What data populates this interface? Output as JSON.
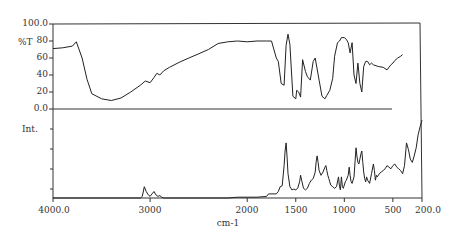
{
  "chart_data": [
    {
      "type": "line",
      "title": "",
      "panel": "upper",
      "ylabel": "%T",
      "xlabel": "cm-1",
      "xlim": [
        4000.0,
        200.0
      ],
      "ylim": [
        0.0,
        100.0
      ],
      "yticks": [
        "100.0",
        "80",
        "60",
        "40",
        "20",
        "0.0"
      ],
      "grid": false,
      "series": [
        {
          "name": "IR transmittance",
          "x": [
            4000,
            3900,
            3800,
            3760,
            3700,
            3650,
            3600,
            3500,
            3400,
            3300,
            3200,
            3100,
            3050,
            3000,
            2960,
            2930,
            2900,
            2860,
            2800,
            2700,
            2600,
            2500,
            2400,
            2300,
            2200,
            2100,
            2000,
            1900,
            1800,
            1750,
            1700,
            1680,
            1650,
            1620,
            1600,
            1580,
            1560,
            1530,
            1500,
            1490,
            1470,
            1450,
            1430,
            1400,
            1380,
            1350,
            1320,
            1300,
            1260,
            1230,
            1200,
            1180,
            1150,
            1120,
            1100,
            1070,
            1050,
            1030,
            1000,
            980,
            960,
            940,
            920,
            900,
            880,
            860,
            840,
            820,
            800,
            780,
            760,
            740,
            720,
            700,
            650,
            600,
            560,
            520,
            500,
            480,
            450,
            420,
            400
          ],
          "y": [
            71,
            72,
            74,
            79,
            60,
            35,
            18,
            12,
            10,
            13,
            20,
            28,
            33,
            31,
            37,
            42,
            40,
            45,
            49,
            55,
            60,
            65,
            70,
            77,
            79,
            80,
            79,
            80,
            80,
            80,
            60,
            56,
            30,
            28,
            75,
            88,
            76,
            15,
            12,
            22,
            20,
            14,
            58,
            44,
            38,
            34,
            56,
            60,
            34,
            15,
            12,
            16,
            22,
            36,
            62,
            78,
            80,
            84,
            84,
            82,
            78,
            66,
            78,
            40,
            30,
            54,
            30,
            20,
            50,
            56,
            56,
            52,
            54,
            52,
            50,
            49,
            46,
            52,
            54,
            57,
            60,
            62,
            64
          ]
        }
      ]
    },
    {
      "type": "line",
      "title": "",
      "panel": "lower",
      "ylabel": "Int.",
      "xlabel": "cm-1",
      "xlim": [
        4000.0,
        200.0
      ],
      "xticks": [
        "4000.0",
        "3000",
        "2000",
        "1500",
        "1000",
        "500",
        "200.0"
      ],
      "ylim": [
        0,
        100
      ],
      "grid": false,
      "series": [
        {
          "name": "Raman intensity",
          "x": [
            4000,
            3200,
            3100,
            3080,
            3060,
            3040,
            3020,
            3000,
            2980,
            2960,
            2940,
            2920,
            2900,
            2880,
            2860,
            2200,
            2100,
            2000,
            1900,
            1800,
            1780,
            1700,
            1680,
            1660,
            1640,
            1620,
            1610,
            1600,
            1590,
            1580,
            1560,
            1540,
            1520,
            1500,
            1480,
            1460,
            1450,
            1440,
            1420,
            1400,
            1380,
            1360,
            1340,
            1320,
            1300,
            1290,
            1280,
            1270,
            1260,
            1240,
            1220,
            1200,
            1190,
            1180,
            1170,
            1160,
            1150,
            1140,
            1120,
            1100,
            1080,
            1060,
            1050,
            1040,
            1030,
            1020,
            1010,
            1000,
            990,
            980,
            960,
            950,
            940,
            930,
            920,
            900,
            880,
            870,
            860,
            850,
            840,
            830,
            820,
            810,
            800,
            790,
            780,
            770,
            760,
            740,
            720,
            700,
            690,
            680,
            670,
            660,
            640,
            620,
            600,
            580,
            560,
            540,
            520,
            500,
            480,
            460,
            440,
            420,
            400,
            380,
            360,
            340,
            320,
            300,
            280,
            260,
            240,
            220,
            200
          ],
          "y": [
            0,
            0,
            0,
            2,
            14,
            8,
            4,
            2,
            5,
            8,
            4,
            2,
            3,
            1,
            0,
            0,
            1,
            1,
            1,
            2,
            5,
            5,
            8,
            14,
            15,
            40,
            58,
            68,
            52,
            30,
            14,
            10,
            11,
            10,
            12,
            20,
            28,
            22,
            12,
            10,
            12,
            18,
            22,
            24,
            32,
            45,
            52,
            44,
            34,
            28,
            32,
            38,
            40,
            34,
            28,
            24,
            20,
            16,
            14,
            12,
            14,
            26,
            14,
            10,
            26,
            14,
            12,
            16,
            20,
            22,
            28,
            38,
            28,
            20,
            18,
            26,
            62,
            52,
            44,
            42,
            48,
            54,
            58,
            44,
            32,
            24,
            20,
            26,
            22,
            18,
            30,
            42,
            34,
            22,
            28,
            26,
            30,
            32,
            34,
            36,
            40,
            38,
            36,
            40,
            42,
            38,
            36,
            34,
            30,
            40,
            68,
            60,
            48,
            44,
            52,
            62,
            78,
            88,
            96,
            100
          ]
        }
      ]
    }
  ],
  "labels": {
    "upper_ylabel": "%T",
    "lower_ylabel": "Int.",
    "xlabel": "cm-1",
    "yticks": [
      "100.0",
      "80",
      "60",
      "40",
      "20",
      "0.0"
    ],
    "xticks": [
      "4000.0",
      "3000",
      "2000",
      "1500",
      "1000",
      "500",
      "200.0"
    ]
  }
}
